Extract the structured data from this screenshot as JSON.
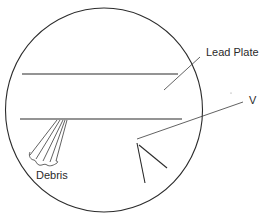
{
  "diagram": {
    "type": "microscope-field-view",
    "labels": {
      "lead_plate": "Lead Plate",
      "v": "V",
      "debris": "Debris"
    },
    "colors": {
      "background": "#ffffff",
      "stroke": "#2b2b2b",
      "text": "#2a2a2a"
    }
  }
}
